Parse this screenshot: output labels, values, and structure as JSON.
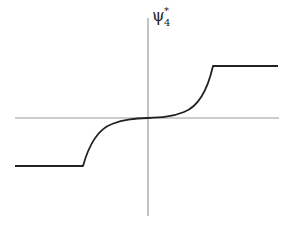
{
  "figure": {
    "y_axis_label": {
      "symbol": "ψ",
      "superscript": "*",
      "subscript": "4"
    },
    "colors": {
      "axis": "#999999",
      "curve": "#222222",
      "background": "#ffffff"
    },
    "axes": {
      "origin_px": [
        148,
        118
      ],
      "x_axis_px": [
        15,
        279
      ],
      "y_axis_px": [
        18,
        216
      ]
    },
    "curve": {
      "description": "antisymmetric saturating S-curve (piecewise: flat lower plateau, steep convex rise, flat near origin, steep rise, flat upper plateau)",
      "lower_plateau_px": {
        "x_start": 15,
        "x_end": 83,
        "y": 166
      },
      "upper_plateau_px": {
        "x_start": 213,
        "x_end": 278,
        "y": 66
      }
    }
  }
}
